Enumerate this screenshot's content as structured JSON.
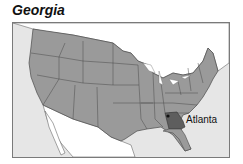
{
  "title": "Georgia",
  "map": {
    "highlighted_state": "Georgia",
    "city_label": "Atlanta",
    "colors": {
      "ocean": "#e6e6e6",
      "land_us": "#9a9a9a",
      "land_foreign": "#ffffff",
      "highlight": "#5e5e5e",
      "borders": "#4a4a4a",
      "frame": "#7a7a7a"
    }
  }
}
